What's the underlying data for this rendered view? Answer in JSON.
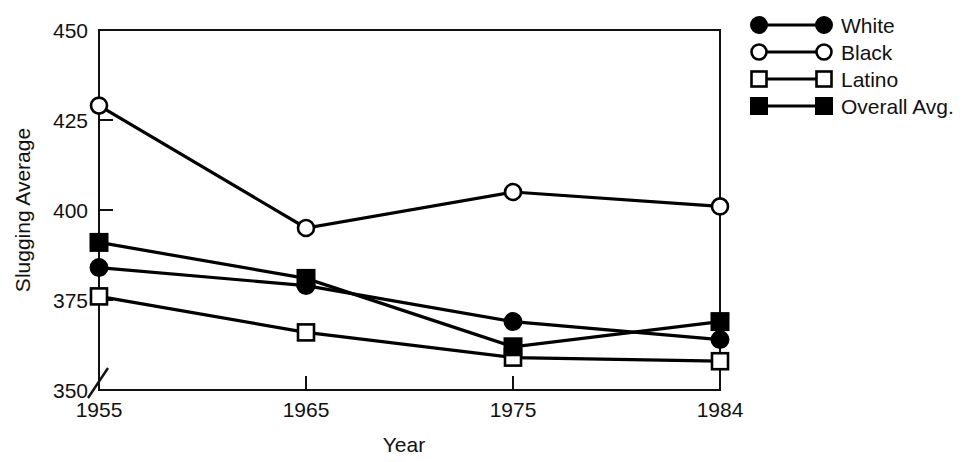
{
  "chart_data": {
    "type": "line",
    "title": "",
    "xlabel": "Year",
    "ylabel": "Slugging Average",
    "x": [
      1955,
      1965,
      1975,
      1984
    ],
    "categories": [
      "1955",
      "1965",
      "1975",
      "1984"
    ],
    "xtick_labels": [
      "1955",
      "1965",
      "1975",
      "1984"
    ],
    "ytick_labels": [
      "350",
      "375",
      "400",
      "425",
      "450"
    ],
    "ytick_values": [
      350,
      375,
      400,
      425,
      450
    ],
    "ylim": [
      350,
      450
    ],
    "y_axis_break": true,
    "y_axis_break_note": "diagonal break slash at origin between 350 and 375",
    "grid": false,
    "legend_position": "right",
    "frame": "box",
    "series": [
      {
        "name": "White",
        "marker": "filled-circle",
        "color": "#000000",
        "values": [
          384,
          379,
          369,
          364
        ]
      },
      {
        "name": "Black",
        "marker": "open-circle",
        "color": "#000000",
        "values": [
          429,
          395,
          405,
          401
        ]
      },
      {
        "name": "Latino",
        "marker": "open-square",
        "color": "#000000",
        "values": [
          376,
          366,
          359,
          358
        ]
      },
      {
        "name": "Overall Avg.",
        "marker": "filled-square",
        "color": "#000000",
        "values": [
          391,
          381,
          362,
          369
        ]
      }
    ]
  },
  "legend": {
    "items": [
      {
        "label": "White",
        "marker": "filled-circle"
      },
      {
        "label": "Black",
        "marker": "open-circle"
      },
      {
        "label": "Latino",
        "marker": "open-square"
      },
      {
        "label": "Overall Avg.",
        "marker": "filled-square"
      }
    ]
  },
  "axes": {
    "y_title": "Slugging Average",
    "x_title": "Year",
    "y_ticks": [
      "450",
      "425",
      "400",
      "375",
      "350"
    ],
    "x_ticks": [
      "1955",
      "1965",
      "1975",
      "1984"
    ]
  }
}
